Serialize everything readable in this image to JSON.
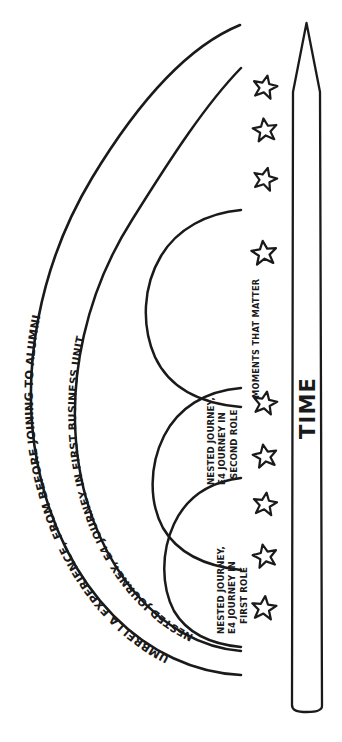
{
  "diagram": {
    "title_outer_arc": "UMBRELLA EXPERIENCE, FROM BEFORE JOINING TO ALUMNI",
    "label_middle_arc": "NESTED JOURNEY, E4 JOURNEY IN FIRST BUSINESS UNIT",
    "label_moments": "MOMENTS THAT MATTER",
    "label_time_axis": "TIME",
    "nested_journeys": [
      {
        "line1": "NESTED JOURNEY,",
        "line2": "E4 JOURNEY IN",
        "line3": "FIRST ROLE"
      },
      {
        "line1": "NESTED JOURNEY,",
        "line2": "E4 JOURNEY IN",
        "line3": "SECOND ROLE"
      }
    ],
    "moment_star_count": 8,
    "ink_color": "#1a1a1a",
    "background_color": "#ffffff"
  }
}
